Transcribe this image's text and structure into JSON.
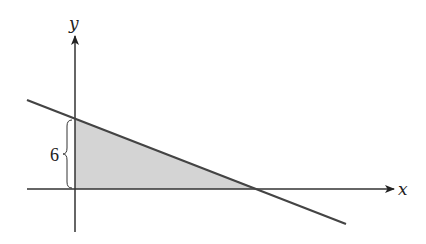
{
  "diagram": {
    "type": "coordinate-plane",
    "axes": {
      "x_label": "x",
      "y_label": "y"
    },
    "line": {
      "description": "decreasing line crossing positive y-axis and positive x-axis",
      "y_intercept_label": "6"
    },
    "shaded_region": {
      "description": "triangle bounded by y-axis, x-axis and the line",
      "fill": "#d4d4d4"
    },
    "brace_label": "6",
    "colors": {
      "axis": "#333333",
      "line": "#444444",
      "shade": "#d4d4d4",
      "text": "#222222"
    }
  }
}
